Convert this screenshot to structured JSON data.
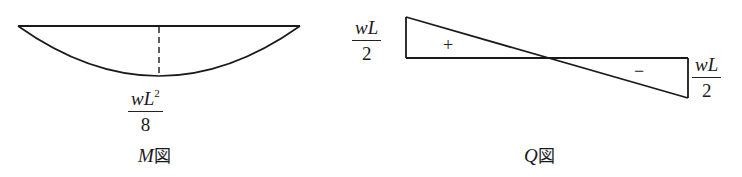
{
  "diagrams": {
    "moment": {
      "caption_var": "M",
      "caption_suffix": "図",
      "peak_label": {
        "numerator": "wL",
        "exponent": "2",
        "denominator": "8"
      }
    },
    "shear": {
      "caption_var": "Q",
      "caption_suffix": "図",
      "left_label": {
        "numerator": "wL",
        "denominator": "2"
      },
      "right_label": {
        "numerator": "wL",
        "denominator": "2"
      },
      "positive_sign": "+",
      "negative_sign": "−"
    }
  },
  "colors": {
    "line": "#1a1a1a",
    "background": "#ffffff"
  }
}
